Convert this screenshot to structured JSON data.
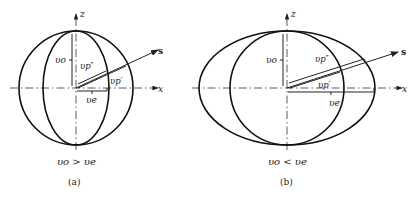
{
  "figure": {
    "panels": [
      {
        "id": "a",
        "caption": "(a)",
        "condition": "v_o > v_e",
        "condition_text": "υo > υe",
        "axes": {
          "z": "z",
          "x": "x",
          "s": "s"
        },
        "labels": {
          "vo": "υo",
          "vp_double": "υp″",
          "vp_single": "υp′",
          "ve": "υe"
        },
        "surfaces": [
          "sphere (ordinary wave)",
          "prolate ellipsoid (extraordinary wave)"
        ]
      },
      {
        "id": "b",
        "caption": "(b)",
        "condition": "v_o < v_e",
        "condition_text": "υo < υe",
        "axes": {
          "z": "z",
          "x": "x",
          "s": "s"
        },
        "labels": {
          "vo": "υo",
          "vp_double": "υp″",
          "vp_single": "υp′",
          "ve": "υe"
        },
        "surfaces": [
          "sphere (ordinary wave)",
          "oblate ellipsoid (extraordinary wave)"
        ]
      }
    ]
  }
}
